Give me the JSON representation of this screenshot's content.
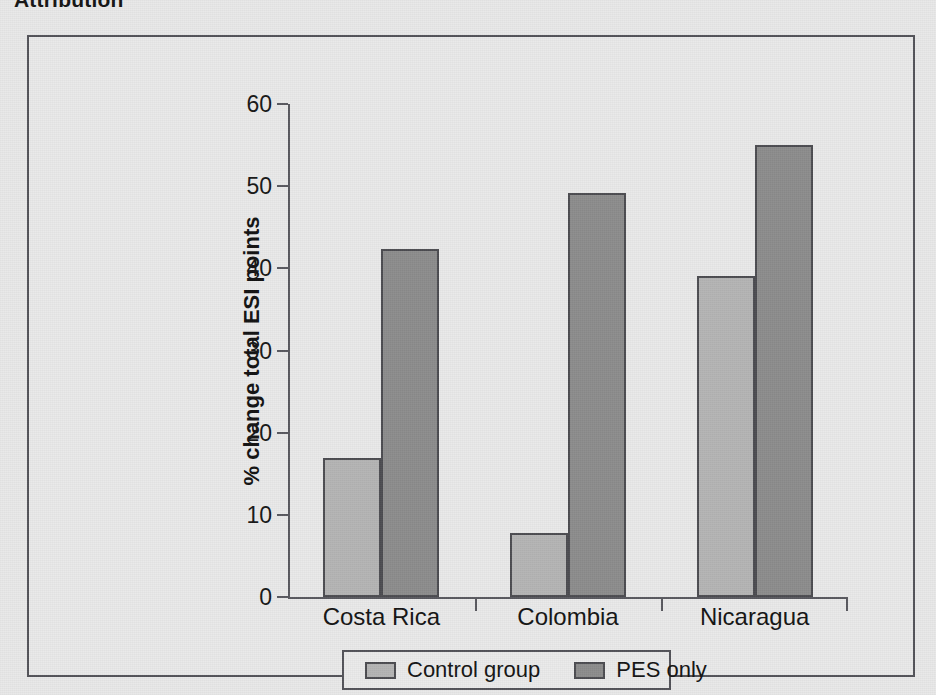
{
  "page": {
    "heading": "Attribution"
  },
  "legend": {
    "position": "bottom-inside",
    "items": [
      {
        "label": "Control group",
        "color": "#b5b5b5",
        "swatch_name": "legend-swatch-control"
      },
      {
        "label": "PES only",
        "color": "#8d8d8d",
        "swatch_name": "legend-swatch-pes"
      }
    ]
  },
  "chart_data": {
    "type": "bar",
    "title": "Attribution",
    "xlabel": "",
    "ylabel": "% change total ESI points",
    "categories": [
      "Costa Rica",
      "Colombia",
      "Nicaragua"
    ],
    "series": [
      {
        "name": "Control group",
        "color": "#b5b5b5",
        "values": [
          16.9,
          7.8,
          39.1
        ]
      },
      {
        "name": "PES only",
        "color": "#8d8d8d",
        "values": [
          42.3,
          49.2,
          55.0
        ]
      }
    ],
    "ylim": [
      0,
      60
    ],
    "yticks": [
      0,
      10,
      20,
      30,
      40,
      50,
      60
    ],
    "ytick_labels": [
      "0",
      "10",
      "20",
      "30",
      "40",
      "50",
      "60"
    ],
    "grid": false,
    "legend_position": "bottom"
  }
}
